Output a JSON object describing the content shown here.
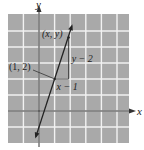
{
  "figure": {
    "axes": {
      "x_label": "x",
      "y_label": "y",
      "x_range": [
        -2,
        5.7
      ],
      "y_range": [
        -2,
        6.2
      ],
      "grid": true,
      "grid_step": 1
    },
    "line": {
      "slope": 3,
      "intercept": -1,
      "x_from": -0.2,
      "x_to": 2.1
    },
    "points": [
      {
        "label": "(1, 2)",
        "x": 1,
        "y": 2
      },
      {
        "label": "(x, y)",
        "x": 1.9,
        "y": 4.6
      }
    ],
    "triangle": {
      "vertical_label": "y − 2",
      "horizontal_label": "x − 1"
    },
    "colors": {
      "grid_bg": "#a9a9a9",
      "grid_line": "#f2f2f2",
      "axis": "#333333",
      "line": "#222222"
    }
  }
}
